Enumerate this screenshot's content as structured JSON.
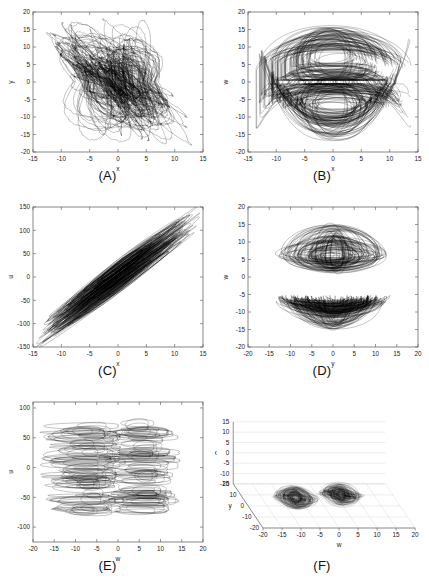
{
  "figure": {
    "title": "",
    "panel_count": 6,
    "caption_partial": ""
  },
  "panels": [
    {
      "letter": "(A)",
      "name": "panel-a",
      "type": "2d",
      "xlabel": "x",
      "ylabel": "y",
      "xlim": [
        -15,
        15
      ],
      "ylim": [
        -20,
        20
      ],
      "xticks": [
        -15,
        -10,
        -5,
        0,
        5,
        10,
        15
      ],
      "yticks": [
        -20,
        -15,
        -10,
        -5,
        0,
        5,
        10,
        15,
        20
      ],
      "xticklabels": [
        "-15",
        "-10",
        "-5",
        "0",
        "5",
        "10",
        "15"
      ],
      "yticklabels": [
        "-20",
        "-15",
        "-10",
        "-5",
        "0",
        "5",
        "10",
        "15",
        "20"
      ],
      "grid": false,
      "shape": "hourglass-double-scroll",
      "seed": 11
    },
    {
      "letter": "(B)",
      "name": "panel-b",
      "type": "2d",
      "xlabel": "x",
      "ylabel": "w",
      "xlim": [
        -15,
        15
      ],
      "ylim": [
        -20,
        20
      ],
      "xticks": [
        -15,
        -10,
        -5,
        0,
        5,
        10,
        15
      ],
      "yticks": [
        -20,
        -15,
        -10,
        -5,
        0,
        5,
        10,
        15,
        20
      ],
      "xticklabels": [
        "-15",
        "-10",
        "-5",
        "0",
        "5",
        "10",
        "15"
      ],
      "yticklabels": [
        "-20",
        "-15",
        "-10",
        "-5",
        "0",
        "5",
        "10",
        "15",
        "20"
      ],
      "grid": false,
      "shape": "mirrored-lobes-vertical-gap",
      "seed": 23
    },
    {
      "letter": "(C)",
      "name": "panel-c",
      "type": "2d",
      "xlabel": "x",
      "ylabel": "u",
      "xlim": [
        -15,
        15
      ],
      "ylim": [
        -150,
        150
      ],
      "xticks": [
        -15,
        -10,
        -5,
        0,
        5,
        10,
        15
      ],
      "yticks": [
        -150,
        -100,
        -50,
        0,
        50,
        100,
        150
      ],
      "xticklabels": [
        "-15",
        "-10",
        "-5",
        "0",
        "5",
        "10",
        "15"
      ],
      "yticklabels": [
        "-150",
        "-100",
        "-50",
        "0",
        "50",
        "100",
        "150"
      ],
      "grid": false,
      "shape": "diagonal-band",
      "seed": 37
    },
    {
      "letter": "(D)",
      "name": "panel-d",
      "type": "2d",
      "xlabel": "y",
      "ylabel": "w",
      "xlim": [
        -20,
        20
      ],
      "ylim": [
        -20,
        20
      ],
      "xticks": [
        -20,
        -15,
        -10,
        -5,
        0,
        5,
        10,
        15,
        20
      ],
      "yticks": [
        -20,
        -15,
        -10,
        -5,
        0,
        5,
        10,
        15,
        20
      ],
      "xticklabels": [
        "-20",
        "-15",
        "-10",
        "-5",
        "0",
        "5",
        "10",
        "15",
        "20"
      ],
      "yticklabels": [
        "-20",
        "-15",
        "-10",
        "-5",
        "0",
        "5",
        "10",
        "15",
        "20"
      ],
      "grid": false,
      "shape": "stacked-eye-lobes",
      "seed": 53
    },
    {
      "letter": "(E)",
      "name": "panel-e",
      "type": "2d",
      "xlabel": "w",
      "ylabel": "u",
      "xlim": [
        -20,
        20
      ],
      "ylim": [
        -125,
        110
      ],
      "xticks": [
        -20,
        -15,
        -10,
        -5,
        0,
        5,
        10,
        15,
        20
      ],
      "yticks": [
        -100,
        -50,
        0,
        50,
        100
      ],
      "xticklabels": [
        "-20",
        "-15",
        "-10",
        "-5",
        "0",
        "5",
        "10",
        "15",
        "20"
      ],
      "yticklabels": [
        "-100",
        "-50",
        "0",
        "50",
        "100"
      ],
      "grid": false,
      "shape": "twin-vertical-columns",
      "seed": 71
    },
    {
      "letter": "(F)",
      "name": "panel-f",
      "type": "3d",
      "xlabel": "w",
      "ylabel": "y",
      "zlabel": "x",
      "xlim": [
        -20,
        20
      ],
      "ylim": [
        -20,
        20
      ],
      "zlim": [
        -15,
        15
      ],
      "xticks": [
        -20,
        -15,
        -10,
        -5,
        0,
        5,
        10,
        15,
        20
      ],
      "yticks": [
        -20,
        -10,
        0,
        10,
        20
      ],
      "zticks": [
        -15,
        -10,
        -5,
        0,
        5,
        10,
        15
      ],
      "xticklabels": [
        "-20",
        "-15",
        "-10",
        "-5",
        "0",
        "5",
        "10",
        "15",
        "20"
      ],
      "yticklabels": [
        "-20",
        "-10",
        "0",
        "10",
        "20"
      ],
      "zticklabels": [
        "-15",
        "-10",
        "-5",
        "0",
        "5",
        "10",
        "15"
      ],
      "grid": true,
      "shape": "four-lobe-3d-projection",
      "seed": 97
    }
  ],
  "chart_data": {
    "type": "line",
    "variables": [
      "x",
      "y",
      "w",
      "u"
    ],
    "projections": [
      {
        "panel": "(A)",
        "x": "x",
        "y": "y",
        "xlim": [
          -15,
          15
        ],
        "ylim": [
          -20,
          20
        ]
      },
      {
        "panel": "(B)",
        "x": "x",
        "y": "w",
        "xlim": [
          -15,
          15
        ],
        "ylim": [
          -20,
          20
        ]
      },
      {
        "panel": "(C)",
        "x": "x",
        "y": "u",
        "xlim": [
          -15,
          15
        ],
        "ylim": [
          -150,
          150
        ]
      },
      {
        "panel": "(D)",
        "x": "y",
        "y": "w",
        "xlim": [
          -20,
          20
        ],
        "ylim": [
          -20,
          20
        ]
      },
      {
        "panel": "(E)",
        "x": "w",
        "y": "u",
        "xlim": [
          -20,
          20
        ],
        "ylim": [
          -125,
          110
        ]
      },
      {
        "panel": "(F)",
        "x": "w",
        "y": "y",
        "z": "x",
        "xlim": [
          -20,
          20
        ],
        "ylim": [
          -20,
          20
        ],
        "zlim": [
          -15,
          15
        ]
      }
    ],
    "legend": [],
    "grid": false,
    "line_color": "#000000"
  }
}
